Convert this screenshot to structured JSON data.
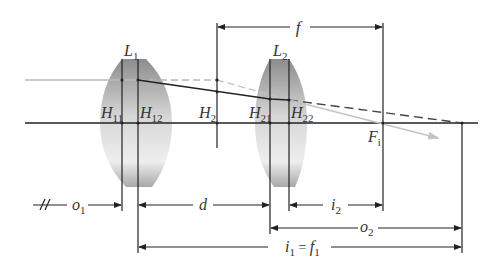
{
  "diagram": {
    "lenses": [
      {
        "name": "L",
        "sub": "1"
      },
      {
        "name": "L",
        "sub": "2"
      }
    ],
    "principal_planes": {
      "h11": {
        "name": "H",
        "sub": "11"
      },
      "h12": {
        "name": "H",
        "sub": "12"
      },
      "h2": {
        "name": "H",
        "sub": "2"
      },
      "h21": {
        "name": "H",
        "sub": "21"
      },
      "h22": {
        "name": "H",
        "sub": "22"
      }
    },
    "focal_point": {
      "name": "F",
      "sub": "i"
    },
    "dimensions": {
      "f": {
        "name": "f"
      },
      "o1": {
        "name": "o",
        "sub": "1"
      },
      "d": {
        "name": "d"
      },
      "i2": {
        "name": "i",
        "sub": "2"
      },
      "o2": {
        "name": "o",
        "sub": "2"
      },
      "i1_eq_f1": {
        "name_a": "i",
        "sub_a": "1",
        "eq": " = ",
        "name_b": "f",
        "sub_b": "1"
      }
    },
    "colors": {
      "line": "#222222",
      "incoming_ray": "#b8b8b8",
      "output_ray": "#bdbdbd",
      "dashed_ray": "#555555",
      "lens_dark": "#8a8a8a",
      "lens_light": "#f2f2f2"
    }
  }
}
